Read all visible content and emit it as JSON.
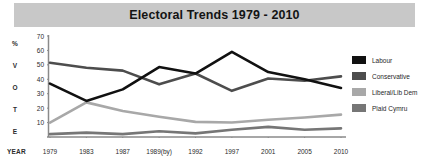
{
  "chart_data": {
    "type": "line",
    "title": "Electoral Trends 1979 - 2010",
    "xlabel": "YEAR",
    "ylabel": "% VOTE",
    "ylabel_letters": [
      "%",
      "V",
      "O",
      "T",
      "E"
    ],
    "categories": [
      "1979",
      "1983",
      "1987",
      "1989(by)",
      "1992",
      "1997",
      "2001",
      "2005",
      "2010"
    ],
    "yticks": [
      10,
      20,
      30,
      40,
      50,
      60,
      70
    ],
    "ylim": [
      0,
      70
    ],
    "grid": false,
    "legend_position": "right",
    "series": [
      {
        "name": "Labour",
        "color": "#111111",
        "values": [
          37,
          25,
          33,
          48.5,
          44,
          59,
          45,
          40,
          34
        ]
      },
      {
        "name": "Conservative",
        "color": "#4d4d4d",
        "values": [
          51.5,
          48,
          46,
          36.5,
          44,
          32,
          40.5,
          39,
          42
        ]
      },
      {
        "name": "Liberal/Lib Dem",
        "color": "#a8a8a8",
        "values": [
          10,
          24,
          18,
          14,
          10.5,
          10,
          12,
          13.5,
          15.5
        ]
      },
      {
        "name": "Plaid Cymru",
        "color": "#767676",
        "values": [
          2,
          3,
          2,
          4,
          2.5,
          5,
          7,
          5,
          6
        ]
      }
    ]
  },
  "title_bar": {
    "text": "Electoral Trends 1979 - 2010"
  },
  "legend": {
    "items": [
      {
        "label": "Labour",
        "color": "#111111"
      },
      {
        "label": "Conservative",
        "color": "#4d4d4d"
      },
      {
        "label": "Liberal/Lib Dem",
        "color": "#a8a8a8"
      },
      {
        "label": "Plaid Cymru",
        "color": "#767676"
      }
    ]
  },
  "axes": {
    "x_axis_caption": "YEAR",
    "axis_color": "#8a8a8a"
  }
}
